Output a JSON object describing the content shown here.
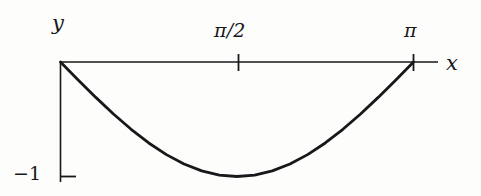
{
  "figure": {
    "title": "",
    "background_color": "#fdfdfc",
    "ink_color": "#16181a"
  },
  "axes": {
    "x_axis_label": "x",
    "y_axis_label": "y",
    "x_tick_labels": [
      "π/2",
      "π"
    ],
    "y_tick_labels": [
      "−1"
    ]
  },
  "labels": {
    "y": "y",
    "x": "x",
    "pi_half": "π/2",
    "pi": "π",
    "minus_one": "−1"
  },
  "chart_data": {
    "type": "line",
    "title": "",
    "xlabel": "x",
    "ylabel": "y",
    "grid": false,
    "legend": false,
    "xlim": [
      0,
      3.14159265
    ],
    "ylim": [
      -1,
      0
    ],
    "xticks": [
      1.5707963,
      3.14159265
    ],
    "xticklabels": [
      "π/2",
      "π"
    ],
    "yticks": [
      -1
    ],
    "yticklabels": [
      "−1"
    ],
    "series": [
      {
        "name": "y = −sin(x)",
        "x": [
          0.0,
          0.15708,
          0.31416,
          0.47124,
          0.62832,
          0.7854,
          0.94248,
          1.09956,
          1.25664,
          1.41372,
          1.5708,
          1.72788,
          1.88496,
          2.04204,
          2.19911,
          2.35619,
          2.51327,
          2.67035,
          2.82743,
          2.98451,
          3.14159
        ],
        "values": [
          0.0,
          -0.15643,
          -0.30902,
          -0.45399,
          -0.58779,
          -0.70711,
          -0.80902,
          -0.89101,
          -0.95106,
          -0.98769,
          -1.0,
          -0.98769,
          -0.95106,
          -0.89101,
          -0.80902,
          -0.70711,
          -0.58779,
          -0.45399,
          -0.30902,
          -0.15643,
          0.0
        ]
      }
    ]
  }
}
